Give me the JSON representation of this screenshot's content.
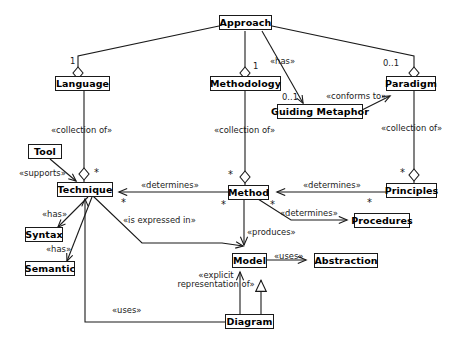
{
  "diagram": {
    "type": "uml-class-diagram",
    "stroke_color": "#1a1a1a",
    "background_color": "#ffffff",
    "nodes": [
      {
        "id": "approach",
        "label": "Approach"
      },
      {
        "id": "language",
        "label": "Language"
      },
      {
        "id": "methodology",
        "label": "Methodology"
      },
      {
        "id": "paradigm",
        "label": "Paradigm"
      },
      {
        "id": "guiding_metaphor",
        "label": "Guiding Metaphor"
      },
      {
        "id": "tool",
        "label": "Tool"
      },
      {
        "id": "technique",
        "label": "Technique"
      },
      {
        "id": "syntax",
        "label": "Syntax"
      },
      {
        "id": "semantic",
        "label": "Semantic"
      },
      {
        "id": "method",
        "label": "Method"
      },
      {
        "id": "principles",
        "label": "Principles"
      },
      {
        "id": "procedures",
        "label": "Procedures"
      },
      {
        "id": "model",
        "label": "Model"
      },
      {
        "id": "abstraction",
        "label": "Abstraction"
      },
      {
        "id": "diagram",
        "label": "Diagram"
      }
    ],
    "edge_labels": {
      "has_approach_metaphor": "«has»",
      "conforms_to": "«conforms to»",
      "collection_of_technique": "«collection of»",
      "collection_of_method": "«collection of»",
      "collection_of_principles": "«collection of»",
      "supports": "«supports»",
      "has_syntax": "«has»",
      "has_semantic": "«has»",
      "determines_technique": "«determines»",
      "determines_method": "«determines»",
      "determines_procedures": "«determines»",
      "produces": "«produces»",
      "is_expressed_in": "«is expressed in»",
      "uses_abstraction": "«uses»",
      "explicit_representation_of": "«explicit representation of»",
      "uses_technique": "«uses»"
    },
    "multiplicities": {
      "approach_language": "1",
      "approach_methodology": "1",
      "approach_paradigm": "0..1",
      "approach_metaphor": "0..1",
      "technique_top": "*",
      "technique_right": "*",
      "method_top": "*",
      "method_left": "*",
      "method_right": "*",
      "principles_top": "*",
      "principles_left": "*"
    }
  }
}
